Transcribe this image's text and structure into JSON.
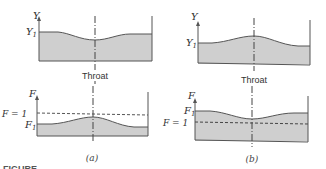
{
  "colors": {
    "water_fill": "#cfcfcf",
    "line": "#555555",
    "background": "#ffffff"
  },
  "panel_a": {
    "caption": "(a)",
    "top": {
      "axis_label": "Y",
      "level_label": "Y",
      "level_subscript": "1",
      "throat_label": "Throat"
    },
    "bottom": {
      "axis_label": "F",
      "critical_label": "F = 1",
      "level_label": "F",
      "level_subscript": "1"
    }
  },
  "panel_b": {
    "caption": "(b)",
    "top": {
      "axis_label": "Y",
      "level_label": "Y",
      "level_subscript": "1",
      "throat_label": "Throat"
    },
    "bottom": {
      "axis_label": "F",
      "critical_label": "F = 1",
      "level_label": "F",
      "level_subscript": "1"
    }
  },
  "figure_label": "FIGURE"
}
